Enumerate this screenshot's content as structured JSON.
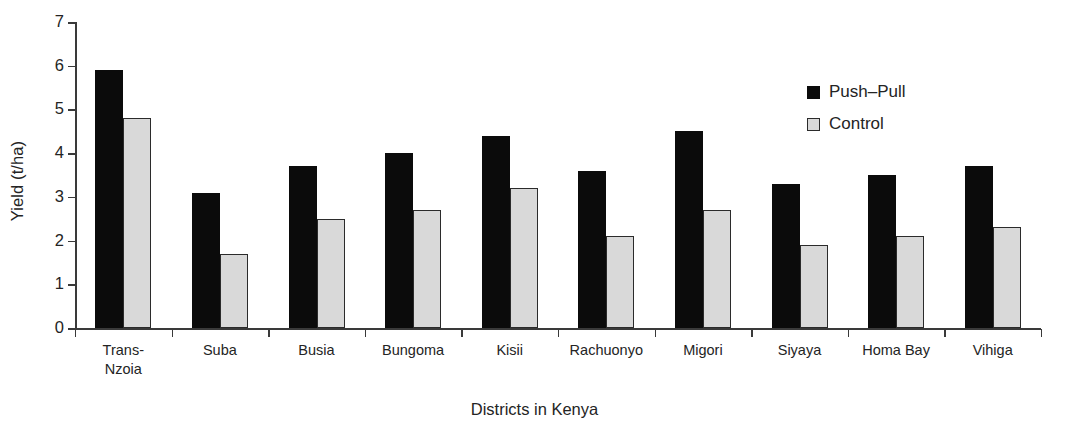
{
  "chart_data": {
    "type": "bar",
    "title": "",
    "xlabel": "Districts in Kenya",
    "ylabel": "Yield (t/ha)",
    "ylim": [
      0,
      7
    ],
    "yticks": [
      0,
      1,
      2,
      3,
      4,
      5,
      6,
      7
    ],
    "grid": false,
    "legend_position": "top-right",
    "categories": [
      "Trans-\nNzoia",
      "Suba",
      "Busia",
      "Bungoma",
      "Kisii",
      "Rachuonyo",
      "Migori",
      "Siyaya",
      "Homa Bay",
      "Vihiga"
    ],
    "series": [
      {
        "name": "Push–Pull",
        "color": "#0b0b0b",
        "values": [
          5.9,
          3.1,
          3.7,
          4.0,
          4.4,
          3.6,
          4.5,
          3.3,
          3.5,
          3.7
        ]
      },
      {
        "name": "Control",
        "color": "#d9d9d9",
        "values": [
          4.8,
          1.7,
          2.5,
          2.7,
          3.2,
          2.1,
          2.7,
          1.9,
          2.1,
          2.3
        ]
      }
    ]
  }
}
